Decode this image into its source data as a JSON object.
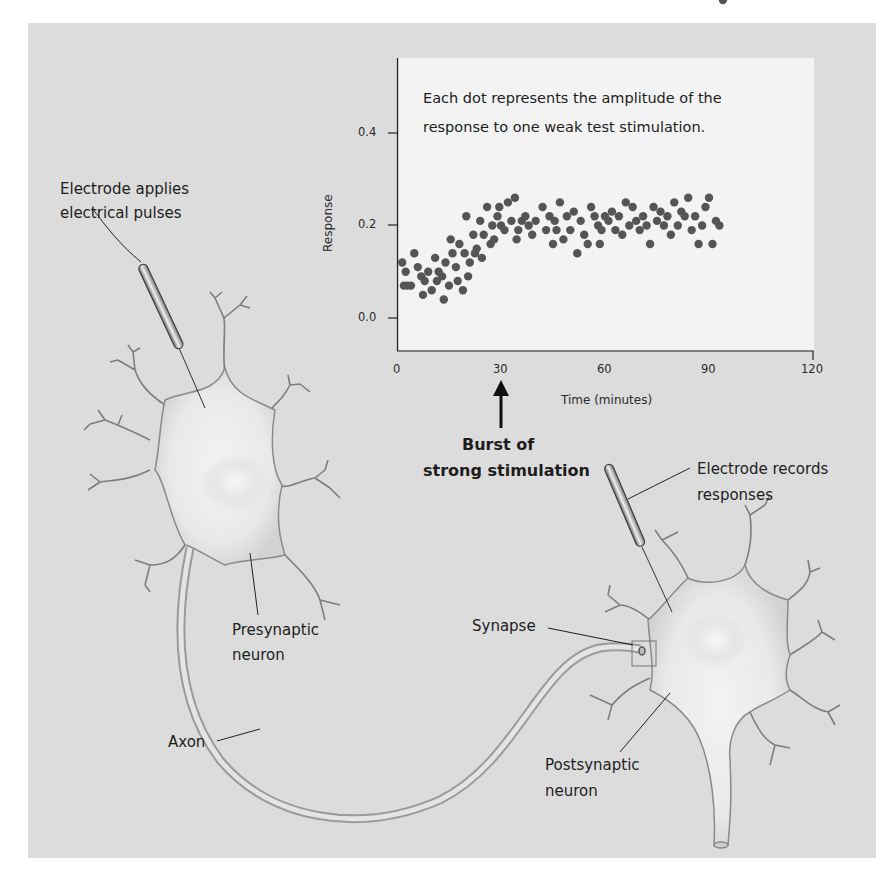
{
  "figure": {
    "background_color": "#dcdcdc",
    "plot_background_color": "#f3f3f3",
    "dot_color": "#555555"
  },
  "chart": {
    "note_line1": "Each dot represents the amplitude of the",
    "note_line2": "response to one weak test stimulation.",
    "ylabel": "Response",
    "xlabel": "Time (minutes)",
    "yticks": [
      "0.4",
      "0.2",
      "0.0"
    ],
    "xticks": [
      "0",
      "30",
      "60",
      "90",
      "120"
    ]
  },
  "annotations": {
    "burst_line1": "Burst of",
    "burst_line2": "strong stimulation",
    "electrode_applies_line1": "Electrode applies",
    "electrode_applies_line2": "electrical pulses",
    "electrode_records_line1": "Electrode records",
    "electrode_records_line2": "responses",
    "presynaptic_line1": "Presynaptic",
    "presynaptic_line2": "neuron",
    "synapse": "Synapse",
    "postsynaptic_line1": "Postsynaptic",
    "postsynaptic_line2": "neuron",
    "axon": "Axon"
  },
  "chart_data": {
    "type": "scatter",
    "xlabel": "Time (minutes)",
    "ylabel": "Response",
    "xlim": [
      0,
      120
    ],
    "ylim": [
      -0.07,
      0.58
    ],
    "xticks": [
      0,
      30,
      60,
      90,
      120
    ],
    "yticks": [
      0.0,
      0.2,
      0.4
    ],
    "grid": false,
    "annotations": [
      {
        "x": 30,
        "text": "Burst of strong stimulation",
        "type": "arrow-up-below-axis"
      }
    ],
    "x": [
      1.5,
      2,
      2.5,
      3,
      4,
      5,
      6,
      7,
      7.5,
      8,
      9,
      10,
      11,
      11.5,
      12,
      13,
      13.5,
      14,
      15,
      15.5,
      16,
      17,
      17.5,
      18,
      19,
      19.5,
      20,
      20.5,
      21,
      22,
      22.5,
      23,
      24,
      24.5,
      25,
      26,
      27,
      27.5,
      28,
      29,
      29.5,
      30,
      31,
      32,
      33,
      34,
      34.5,
      35,
      36,
      37,
      38,
      39,
      40,
      42,
      43,
      44,
      45,
      45.5,
      46,
      47,
      48,
      49,
      50,
      51,
      52,
      53,
      54,
      55,
      56,
      57,
      58,
      58.5,
      59,
      60,
      61,
      62,
      63,
      64,
      65,
      66,
      67,
      68,
      69,
      70,
      71,
      72,
      73,
      74,
      75,
      76,
      77,
      78,
      79,
      80,
      81,
      82,
      83,
      84,
      85,
      86,
      87,
      88,
      89,
      90,
      91,
      92,
      93,
      94
    ],
    "y": [
      0.12,
      0.07,
      0.1,
      0.07,
      0.07,
      0.14,
      0.11,
      0.09,
      0.05,
      0.08,
      0.1,
      0.06,
      0.13,
      0.08,
      0.1,
      0.09,
      0.04,
      0.12,
      0.07,
      0.17,
      0.14,
      0.11,
      0.08,
      0.16,
      0.06,
      0.14,
      0.22,
      0.09,
      0.12,
      0.18,
      0.14,
      0.15,
      0.21,
      0.13,
      0.18,
      0.24,
      0.16,
      0.2,
      0.17,
      0.22,
      0.24,
      0.2,
      0.19,
      0.25,
      0.21,
      0.26,
      0.17,
      0.19,
      0.21,
      0.22,
      0.2,
      0.18,
      0.21,
      0.24,
      0.19,
      0.22,
      0.16,
      0.21,
      0.19,
      0.25,
      0.17,
      0.22,
      0.19,
      0.23,
      0.14,
      0.21,
      0.18,
      0.16,
      0.24,
      0.22,
      0.2,
      0.16,
      0.19,
      0.22,
      0.21,
      0.23,
      0.19,
      0.22,
      0.18,
      0.25,
      0.2,
      0.24,
      0.21,
      0.19,
      0.22,
      0.2,
      0.16,
      0.24,
      0.21,
      0.23,
      0.2,
      0.22,
      0.18,
      0.25,
      0.2,
      0.23,
      0.22,
      0.26,
      0.19,
      0.22,
      0.16,
      0.2,
      0.24,
      0.26,
      0.16,
      0.21,
      0.2
    ]
  }
}
